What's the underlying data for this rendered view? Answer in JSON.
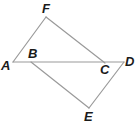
{
  "diagram": {
    "type": "geometry",
    "points": {
      "A": {
        "label": "A",
        "x": 13,
        "y": 62,
        "lx": 1,
        "ly": 70
      },
      "B": {
        "label": "B",
        "x": 31,
        "y": 62,
        "lx": 28,
        "ly": 58
      },
      "C": {
        "label": "C",
        "x": 105,
        "y": 63,
        "lx": 100,
        "ly": 74
      },
      "D": {
        "label": "D",
        "x": 124,
        "y": 62,
        "lx": 125,
        "ly": 66
      },
      "E": {
        "label": "E",
        "x": 89,
        "y": 108,
        "lx": 84,
        "ly": 121
      },
      "F": {
        "label": "F",
        "x": 46,
        "y": 17,
        "lx": 42,
        "ly": 13
      }
    },
    "segments": [
      {
        "from": "A",
        "to": "F"
      },
      {
        "from": "F",
        "to": "C"
      },
      {
        "from": "A",
        "to": "D"
      },
      {
        "from": "B",
        "to": "E"
      },
      {
        "from": "E",
        "to": "D"
      }
    ],
    "colors": {
      "line": "#9a9a9a",
      "label": "#1a1a1a",
      "background": "#ffffff"
    }
  }
}
